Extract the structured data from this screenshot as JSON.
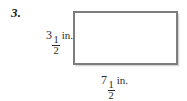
{
  "problem": {
    "number_label": "3."
  },
  "figure": {
    "shape": "rectangle",
    "border_color": "#7d7d7d",
    "fill_color": "#ffffff"
  },
  "dimensions": {
    "height": {
      "whole": "3",
      "numerator": "1",
      "denominator": "2",
      "unit": "in.",
      "position": "left"
    },
    "width": {
      "whole": "7",
      "numerator": "1",
      "denominator": "2",
      "unit": "in.",
      "position": "bottom"
    }
  }
}
